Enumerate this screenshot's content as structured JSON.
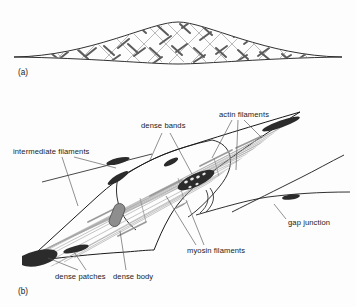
{
  "figure": {
    "panels": [
      {
        "id": "a",
        "label": "(a)",
        "caption": "whole spindle-shaped smooth muscle cell with criss-cross contractile lattice"
      },
      {
        "id": "b",
        "label": "(b)",
        "caption": "cutaway detail of smooth muscle cell cytoskeleton and junctions"
      }
    ]
  },
  "labels": {
    "intermediate_filaments": "intermediate filaments",
    "dense_bands": "dense bands",
    "actin_filaments": "actin filaments",
    "myosin_filaments": "myosin filaments",
    "gap_junction": "gap junction",
    "dense_patches": "dense patches",
    "dense_body": "dense body"
  },
  "colors": {
    "background": "#fdfdfd",
    "outline": "#1a1a1a",
    "filament_gray": "#9a9a9a",
    "dense_dark": "#2b2b2b",
    "dense_body_gray": "#8e8e8e",
    "leader_line": "#555555",
    "text": "#1a1a1a"
  },
  "diagram": {
    "type": "biological-schematic",
    "panel_a": {
      "shape": "lens / spindle cell profile",
      "lattice": "diagonal criss-cross filament bundles with dark dashed dense bodies"
    },
    "panel_b": {
      "main_cell": "elongated tapered cell drawn in oblique view",
      "neighbor_cell": "adjacent cell at lower right joined by gap junction",
      "features": [
        "dense bands along plasma membrane",
        "dense body within cytoplasm",
        "dense patches at tapered tip",
        "actin filaments running longitudinally",
        "myosin filaments between actin",
        "intermediate filaments spanning dense bodies",
        "gap junction between adjacent cells"
      ]
    }
  }
}
